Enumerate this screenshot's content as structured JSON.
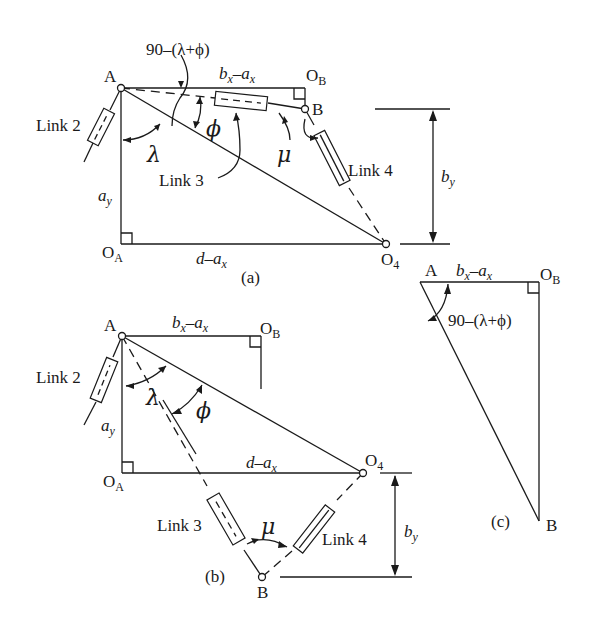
{
  "diagram": {
    "panels": {
      "a": {
        "caption": "(a)",
        "points": [
          "A",
          "O_B",
          "B",
          "O_A",
          "O_4"
        ],
        "labels": {
          "A": "A",
          "O": "O",
          "B_sub": "B",
          "A_sub": "A",
          "four_sub": "4",
          "B": "B",
          "angle_expr": "90–(λ+ϕ)",
          "bx": "b",
          "x_sub": "x",
          "minus": "–",
          "ax": "a",
          "link2": "Link 2",
          "link3": "Link 3",
          "link4": "Link 4",
          "lambda": "λ",
          "phi": "ϕ",
          "mu": "μ",
          "ay": "a",
          "y_sub": "y",
          "by": "b",
          "d": "d"
        }
      },
      "b": {
        "caption": "(b)",
        "labels": {
          "A": "A",
          "O": "O",
          "B_sub": "B",
          "A_sub": "A",
          "four_sub": "4",
          "B": "B",
          "bx": "b",
          "x_sub": "x",
          "minus": "–",
          "ax": "a",
          "link2": "Link 2",
          "link3": "Link 3",
          "link4": "Link 4",
          "lambda": "λ",
          "phi": "ϕ",
          "mu": "μ",
          "ay": "a",
          "y_sub": "y",
          "by": "b",
          "d": "d"
        }
      },
      "c": {
        "caption": "(c)",
        "labels": {
          "A": "A",
          "O": "O",
          "B_sub": "B",
          "B": "B",
          "bx": "b",
          "x_sub": "x",
          "minus": "–",
          "ax": "a",
          "angle_expr": "90–(λ+ϕ)"
        }
      }
    }
  }
}
